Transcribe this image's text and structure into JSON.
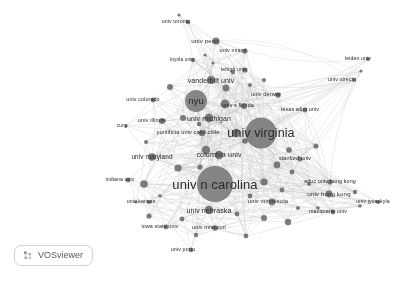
{
  "app": {
    "name": "VOSviewer",
    "logo_icon": "vosviewer-logo-icon",
    "background_color": "#ffffff",
    "node_color": "#6e6e6e",
    "edge_color": "#c8c8c8",
    "label_color": "#2b2b2b"
  },
  "chart_data": {
    "type": "scatter",
    "title": "",
    "subtitle": "",
    "xlabel": "",
    "ylabel": "",
    "grid": false,
    "legend": "none",
    "xlim": [
      0,
      410
    ],
    "ylim": [
      0,
      281
    ],
    "nodes": [
      {
        "label": "univ toronto",
        "x": 188,
        "y": 22,
        "weight": 3,
        "radius": 2.2,
        "font_size": 5.2,
        "label_dx": -12,
        "label_dy": 0
      },
      {
        "label": "univ penn",
        "x": 216,
        "y": 41,
        "weight": 8,
        "radius": 3.6,
        "font_size": 6.2,
        "label_dx": -11,
        "label_dy": 0
      },
      {
        "label": "univ miami",
        "x": 245,
        "y": 51,
        "weight": 5,
        "radius": 2.6,
        "font_size": 5.4,
        "label_dx": -12,
        "label_dy": 0
      },
      {
        "label": "loyola univ",
        "x": 193,
        "y": 60,
        "weight": 3,
        "radius": 2.2,
        "font_size": 4.8,
        "label_dx": -11,
        "label_dy": 0
      },
      {
        "label": "lehigh univ",
        "x": 245,
        "y": 70,
        "weight": 4,
        "radius": 2.6,
        "font_size": 5.2,
        "label_dx": -11,
        "label_dy": 0
      },
      {
        "label": "vanderbilt univ",
        "x": 211,
        "y": 80,
        "weight": 9,
        "radius": 4.0,
        "font_size": 7.0,
        "label_dx": 0,
        "label_dy": 0
      },
      {
        "label": "univ utrecht",
        "x": 354,
        "y": 80,
        "weight": 3,
        "radius": 1.9,
        "font_size": 5.2,
        "label_dx": -12,
        "label_dy": 0
      },
      {
        "label": "leiden univ",
        "x": 368,
        "y": 59,
        "weight": 3,
        "radius": 2.0,
        "font_size": 5.2,
        "label_dx": -10,
        "label_dy": 0
      },
      {
        "label": "univ denver",
        "x": 278,
        "y": 95,
        "weight": 5,
        "radius": 2.8,
        "font_size": 5.6,
        "label_dx": -12,
        "label_dy": 0
      },
      {
        "label": "nyu",
        "x": 196,
        "y": 101,
        "weight": 22,
        "radius": 11.0,
        "font_size": 9.5,
        "label_dx": 0,
        "label_dy": 0
      },
      {
        "label": "univ colorado",
        "x": 153,
        "y": 100,
        "weight": 4,
        "radius": 2.4,
        "font_size": 5.4,
        "label_dx": -10,
        "label_dy": 0
      },
      {
        "label": "univ s florida",
        "x": 244,
        "y": 106,
        "weight": 6,
        "radius": 3.0,
        "font_size": 5.4,
        "label_dx": -6,
        "label_dy": 0
      },
      {
        "label": "texas a&m univ",
        "x": 305,
        "y": 110,
        "weight": 4,
        "radius": 2.4,
        "font_size": 5.4,
        "label_dx": -5,
        "label_dy": 0
      },
      {
        "label": "univ michigan",
        "x": 209,
        "y": 118,
        "weight": 11,
        "radius": 4.4,
        "font_size": 7.0,
        "label_dx": 0,
        "label_dy": 0
      },
      {
        "label": "univ illinois",
        "x": 162,
        "y": 121,
        "weight": 6,
        "radius": 3.0,
        "font_size": 5.6,
        "label_dx": -10,
        "label_dy": 0
      },
      {
        "label": "cuny",
        "x": 126,
        "y": 126,
        "weight": 2,
        "radius": 1.7,
        "font_size": 4.8,
        "label_dx": -4,
        "label_dy": 0
      },
      {
        "label": "pontificia univ catol chile",
        "x": 202,
        "y": 133,
        "weight": 6,
        "radius": 3.2,
        "font_size": 5.6,
        "label_dx": -14,
        "label_dy": 0
      },
      {
        "label": "univ virginia",
        "x": 261,
        "y": 133,
        "weight": 28,
        "radius": 15.5,
        "font_size": 12.5,
        "label_dx": 0,
        "label_dy": 0
      },
      {
        "label": "columbia univ",
        "x": 219,
        "y": 155,
        "weight": 10,
        "radius": 4.2,
        "font_size": 7.2,
        "label_dx": 0,
        "label_dy": 0
      },
      {
        "label": "univ maryland",
        "x": 152,
        "y": 157,
        "weight": 8,
        "radius": 3.8,
        "font_size": 6.4,
        "label_dx": 0,
        "label_dy": 0
      },
      {
        "label": "stanford univ",
        "x": 300,
        "y": 159,
        "weight": 4,
        "radius": 2.5,
        "font_size": 5.4,
        "label_dx": -5,
        "label_dy": 0
      },
      {
        "label": "indiana univ",
        "x": 128,
        "y": 180,
        "weight": 4,
        "radius": 2.4,
        "font_size": 5.2,
        "label_dx": -8,
        "label_dy": 0
      },
      {
        "label": "univ n carolina",
        "x": 215,
        "y": 184,
        "weight": 30,
        "radius": 18.0,
        "font_size": 13.0,
        "label_dx": 0,
        "label_dy": 0
      },
      {
        "label": "educ univ hong kong",
        "x": 330,
        "y": 182,
        "weight": 5,
        "radius": 2.6,
        "font_size": 5.4,
        "label_dx": 0,
        "label_dy": 0
      },
      {
        "label": "univ hong kong",
        "x": 329,
        "y": 194,
        "weight": 7,
        "radius": 3.4,
        "font_size": 6.2,
        "label_dx": 0,
        "label_dy": 0
      },
      {
        "label": "univ kansas",
        "x": 149,
        "y": 202,
        "weight": 3,
        "radius": 2.0,
        "font_size": 5.2,
        "label_dx": -8,
        "label_dy": 0
      },
      {
        "label": "univ minnesota",
        "x": 272,
        "y": 202,
        "weight": 7,
        "radius": 3.4,
        "font_size": 5.8,
        "label_dx": -4,
        "label_dy": 0
      },
      {
        "label": "univ nebraska",
        "x": 209,
        "y": 210,
        "weight": 10,
        "radius": 4.2,
        "font_size": 7.0,
        "label_dx": 0,
        "label_dy": 0
      },
      {
        "label": "macquarie univ",
        "x": 333,
        "y": 212,
        "weight": 4,
        "radius": 2.4,
        "font_size": 5.4,
        "label_dx": -5,
        "label_dy": 0
      },
      {
        "label": "univ jyvaskyla",
        "x": 378,
        "y": 202,
        "weight": 3,
        "radius": 2.0,
        "font_size": 5.2,
        "label_dx": -5,
        "label_dy": 0
      },
      {
        "label": "iowa state univ",
        "x": 166,
        "y": 227,
        "weight": 4,
        "radius": 2.4,
        "font_size": 5.4,
        "label_dx": -6,
        "label_dy": 0
      },
      {
        "label": "univ missouri",
        "x": 215,
        "y": 228,
        "weight": 5,
        "radius": 2.8,
        "font_size": 5.6,
        "label_dx": -6,
        "label_dy": 0
      },
      {
        "label": "univ porto",
        "x": 191,
        "y": 250,
        "weight": 3,
        "radius": 2.2,
        "font_size": 5.4,
        "label_dx": -8,
        "label_dy": 0
      }
    ],
    "unlabeled_nodes": [
      {
        "x": 179,
        "y": 15,
        "radius": 1.6
      },
      {
        "x": 213,
        "y": 63,
        "radius": 1.6
      },
      {
        "x": 170,
        "y": 87,
        "radius": 3.0
      },
      {
        "x": 226,
        "y": 88,
        "radius": 3.4
      },
      {
        "x": 250,
        "y": 85,
        "radius": 2.0
      },
      {
        "x": 264,
        "y": 80,
        "radius": 2.0
      },
      {
        "x": 361,
        "y": 71,
        "radius": 1.6
      },
      {
        "x": 225,
        "y": 104,
        "radius": 4.4
      },
      {
        "x": 183,
        "y": 118,
        "radius": 3.0
      },
      {
        "x": 199,
        "y": 124,
        "radius": 2.2
      },
      {
        "x": 236,
        "y": 133,
        "radius": 4.2
      },
      {
        "x": 245,
        "y": 141,
        "radius": 2.8
      },
      {
        "x": 146,
        "y": 142,
        "radius": 2.0
      },
      {
        "x": 206,
        "y": 150,
        "radius": 4.2
      },
      {
        "x": 289,
        "y": 150,
        "radius": 2.8
      },
      {
        "x": 316,
        "y": 146,
        "radius": 2.6
      },
      {
        "x": 178,
        "y": 168,
        "radius": 3.6
      },
      {
        "x": 200,
        "y": 167,
        "radius": 2.6
      },
      {
        "x": 277,
        "y": 165,
        "radius": 3.4
      },
      {
        "x": 292,
        "y": 172,
        "radius": 2.4
      },
      {
        "x": 144,
        "y": 184,
        "radius": 3.8
      },
      {
        "x": 264,
        "y": 182,
        "radius": 3.6
      },
      {
        "x": 309,
        "y": 184,
        "radius": 2.0
      },
      {
        "x": 136,
        "y": 202,
        "radius": 1.6
      },
      {
        "x": 250,
        "y": 196,
        "radius": 2.4
      },
      {
        "x": 282,
        "y": 190,
        "radius": 2.4
      },
      {
        "x": 298,
        "y": 208,
        "radius": 2.0
      },
      {
        "x": 355,
        "y": 192,
        "radius": 2.2
      },
      {
        "x": 360,
        "y": 206,
        "radius": 1.8
      },
      {
        "x": 149,
        "y": 216,
        "radius": 2.6
      },
      {
        "x": 182,
        "y": 219,
        "radius": 2.4
      },
      {
        "x": 237,
        "y": 214,
        "radius": 2.4
      },
      {
        "x": 264,
        "y": 218,
        "radius": 3.0
      },
      {
        "x": 288,
        "y": 222,
        "radius": 3.2
      },
      {
        "x": 318,
        "y": 208,
        "radius": 1.8
      },
      {
        "x": 196,
        "y": 235,
        "radius": 2.2
      },
      {
        "x": 246,
        "y": 236,
        "radius": 2.4
      },
      {
        "x": 160,
        "y": 196,
        "radius": 1.8
      },
      {
        "x": 233,
        "y": 72,
        "radius": 2.2
      },
      {
        "x": 205,
        "y": 55,
        "radius": 1.6
      }
    ]
  }
}
